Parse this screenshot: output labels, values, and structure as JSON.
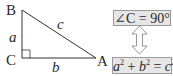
{
  "triangle": {
    "vertices": {
      "B": "B",
      "C": "C",
      "A": "A"
    },
    "sides": {
      "a": "a",
      "b": "b",
      "c": "c"
    },
    "right_angle_at": "C"
  },
  "conditions": {
    "angle": {
      "prefix": "∠C = 90",
      "degree": "°"
    },
    "pythagoras": {
      "a": "a",
      "a_exp": "2",
      "plus": " + ",
      "b": "b",
      "b_exp": "2",
      "equals": " = ",
      "c": "c",
      "c_exp": "2"
    },
    "arrow": "double-headed equivalence arrow"
  },
  "colors": {
    "line": "#333333",
    "box_fill": "#e6e6e6",
    "box_border": "#9a9a9a",
    "arrow_outline": "#8a8a8a"
  }
}
